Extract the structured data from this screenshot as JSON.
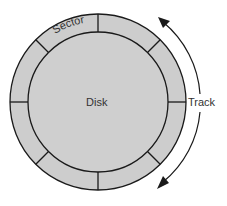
{
  "diagram": {
    "labels": {
      "sector": "Sector",
      "disk": "Disk",
      "track": "Track"
    },
    "geometry": {
      "center": [
        98,
        102
      ],
      "outer_radius": 88,
      "inner_radius": 70,
      "track_arc_radius": 102,
      "sector_count": 8
    },
    "colors": {
      "disk_fill": "#cfcfcf",
      "sector_ring_fill": "#cdcdcd",
      "stroke": "#1a1a1a",
      "label": "#333333",
      "background": "#ffffff"
    },
    "components": [
      {
        "name": "disk",
        "shape": "circle",
        "label": "Disk"
      },
      {
        "name": "sector-ring",
        "shape": "annulus",
        "divisions": 8,
        "label": "Sector"
      },
      {
        "name": "track-arrow",
        "shape": "double-headed arc",
        "label": "Track"
      }
    ]
  }
}
